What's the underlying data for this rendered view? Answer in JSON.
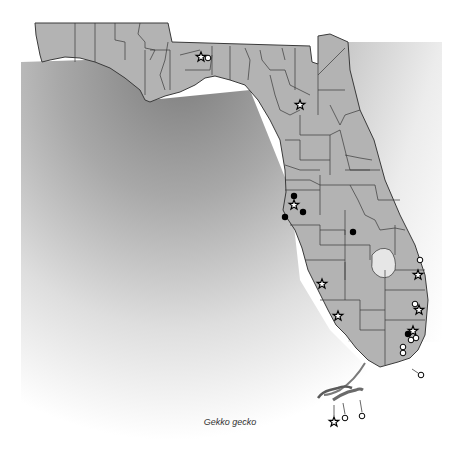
{
  "map": {
    "region": "Florida",
    "species": "Gekko gecko",
    "caption": "Gekko gecko",
    "colors": {
      "land": "#b3b3b3",
      "county_border": "#3a3a3a",
      "water_dark": "#8a8a8a",
      "water_light": "#ffffff",
      "lake": "#e6e6e6"
    },
    "legend_symbols": {
      "star": "open star marker",
      "open_circle": "open circle marker",
      "filled_circle": "filled circle marker"
    },
    "markers": [
      {
        "type": "star",
        "x": 201,
        "y": 57
      },
      {
        "type": "open_circle",
        "x": 208,
        "y": 58
      },
      {
        "type": "star",
        "x": 300,
        "y": 105
      },
      {
        "type": "filled_circle",
        "x": 294,
        "y": 196
      },
      {
        "type": "star",
        "x": 294,
        "y": 205
      },
      {
        "type": "filled_circle",
        "x": 285,
        "y": 217
      },
      {
        "type": "filled_circle",
        "x": 303,
        "y": 212
      },
      {
        "type": "filled_circle",
        "x": 353,
        "y": 232
      },
      {
        "type": "open_circle",
        "x": 420,
        "y": 260
      },
      {
        "type": "star",
        "x": 418,
        "y": 275
      },
      {
        "type": "star",
        "x": 322,
        "y": 284
      },
      {
        "type": "star",
        "x": 338,
        "y": 316
      },
      {
        "type": "open_circle",
        "x": 415,
        "y": 304
      },
      {
        "type": "star",
        "x": 419,
        "y": 310
      },
      {
        "type": "filled_circle",
        "x": 408,
        "y": 334
      },
      {
        "type": "star",
        "x": 413,
        "y": 331
      },
      {
        "type": "open_circle",
        "x": 411,
        "y": 340
      },
      {
        "type": "open_circle",
        "x": 416,
        "y": 338
      },
      {
        "type": "open_circle",
        "x": 403,
        "y": 347
      },
      {
        "type": "open_circle",
        "x": 403,
        "y": 353
      },
      {
        "type": "open_circle",
        "x": 421,
        "y": 375
      },
      {
        "type": "star",
        "x": 334,
        "y": 422
      },
      {
        "type": "open_circle",
        "x": 345,
        "y": 418
      },
      {
        "type": "open_circle",
        "x": 362,
        "y": 416
      }
    ]
  }
}
